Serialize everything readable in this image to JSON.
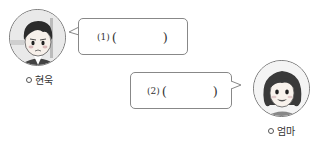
{
  "characters": [
    {
      "name": "현욱",
      "role": "boy"
    },
    {
      "name": "엄마",
      "role": "mother"
    }
  ],
  "bubbles": [
    {
      "number": "(1)",
      "open": "(",
      "blank": "",
      "close": ")"
    },
    {
      "number": "(2)",
      "open": "(",
      "blank": "",
      "close": ")"
    }
  ],
  "colors": {
    "border": "#888888",
    "text": "#333333",
    "background": "#ffffff"
  }
}
